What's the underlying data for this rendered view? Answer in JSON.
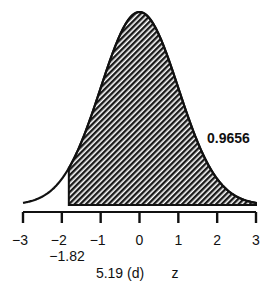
{
  "chart_data": {
    "type": "area",
    "title": "",
    "distribution": "standard normal",
    "xlabel": "z",
    "ylabel": "",
    "xlim": [
      -3,
      3
    ],
    "x_ticks": [
      -3,
      -2,
      -1,
      0,
      1,
      2,
      3
    ],
    "x_tick_labels": [
      "−3",
      "−2",
      "−1",
      "0",
      "1",
      "2",
      "3"
    ],
    "shaded_region": {
      "from": -1.82,
      "to": 3,
      "area": 0.9656
    },
    "annotations": {
      "area_label": "0.9656",
      "cutoff_label": "−1.82",
      "cutoff_value": -1.82,
      "caption": "5.19 (d)",
      "axis_label": "z"
    },
    "grid": false,
    "legend": "none",
    "colors": {
      "line": "#111111",
      "hatch": "#1a1a1a",
      "background": "#ffffff"
    }
  }
}
